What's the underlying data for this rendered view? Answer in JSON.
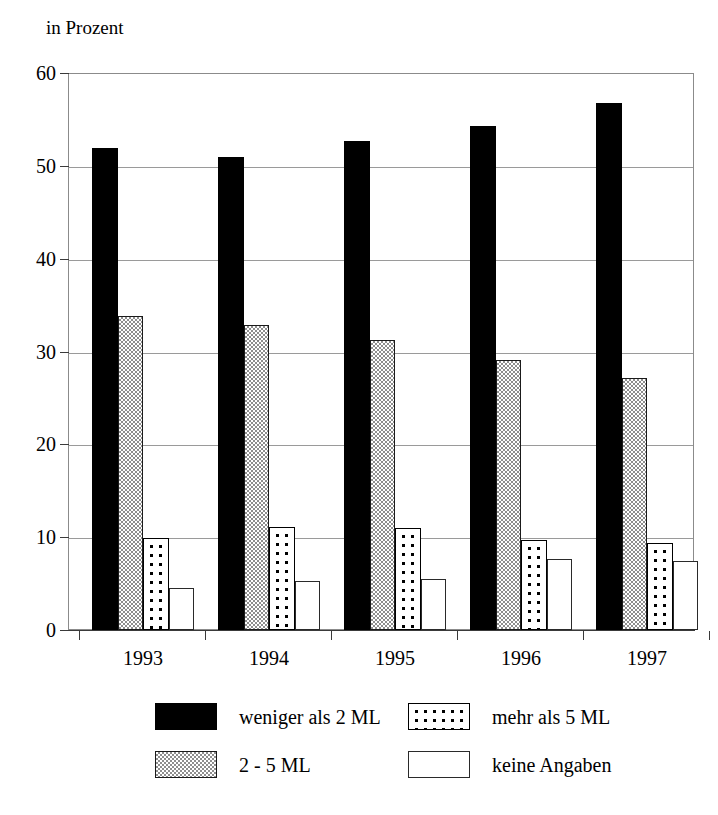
{
  "caption": "in Prozent",
  "chart_data": {
    "type": "bar",
    "title": "",
    "subtitle": "",
    "xlabel": "",
    "ylabel": "in Prozent",
    "ylim": [
      0,
      60
    ],
    "yticks": [
      0,
      10,
      20,
      30,
      40,
      50,
      60
    ],
    "ytick_labels": [
      "0",
      "10",
      "20",
      "30",
      "40",
      "50",
      "60"
    ],
    "grid": true,
    "grid_axis": "y",
    "legend_position": "bottom",
    "categories": [
      "1993",
      "1994",
      "1995",
      "1996",
      "1997"
    ],
    "series": [
      {
        "name": "weniger als 2 ML",
        "fill": "solid-black",
        "color": "#000000",
        "values": [
          51.9,
          51.0,
          52.7,
          54.3,
          56.8
        ]
      },
      {
        "name": "2 - 5 ML",
        "fill": "checker-gray",
        "color": "#8e8e8e",
        "values": [
          33.8,
          32.9,
          31.2,
          29.1,
          27.1
        ]
      },
      {
        "name": "mehr als 5 ML",
        "fill": "dotted",
        "color": "#ffffff",
        "values": [
          9.9,
          11.1,
          11.0,
          9.7,
          9.4
        ]
      },
      {
        "name": "keine Angaben",
        "fill": "plain-white",
        "color": "#ffffff",
        "values": [
          4.5,
          5.3,
          5.5,
          7.6,
          7.4
        ]
      }
    ]
  },
  "legend": [
    {
      "label": "weniger als 2 ML",
      "fill": "solid-black"
    },
    {
      "label": "mehr als 5 ML",
      "fill": "dotted"
    },
    {
      "label": "2 - 5 ML",
      "fill": "checker-gray"
    },
    {
      "label": "keine Angaben",
      "fill": "plain-white"
    }
  ]
}
